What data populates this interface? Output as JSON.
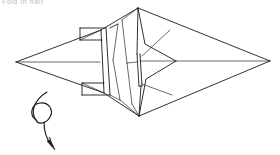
{
  "document": {
    "kind": "origami-folding-diagram",
    "background_color": "#ffffff",
    "ink_color": "#1a1a1a",
    "width": 280,
    "height": 155
  },
  "caption": {
    "text": "Fold in half",
    "note": "faint partially cropped text fragment at top-left edge",
    "color": "#b9b9b9"
  },
  "figure": {
    "name": "double-pointed-folded-model",
    "key_points": {
      "left_tip": [
        16,
        62
      ],
      "right_tip": [
        270,
        61
      ],
      "top_apex": [
        138,
        8
      ],
      "bottom_apex": [
        139,
        116
      ],
      "chevron_apex": [
        176,
        61
      ],
      "slit_top": [
        138,
        54
      ],
      "slit_bottom": [
        140,
        86
      ]
    }
  },
  "symbols": {
    "rotate_arrow": {
      "name": "turn-over-rotation-arrow",
      "description": "Looped arrow indicating the model should be turned over / rotated",
      "anchor": [
        48,
        118
      ]
    }
  }
}
